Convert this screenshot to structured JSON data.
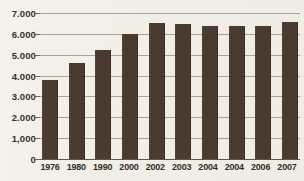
{
  "chart_data": {
    "type": "bar",
    "title": "",
    "xlabel": "",
    "ylabel": "",
    "grid": true,
    "legend": "none",
    "ylim": [
      0,
      7000
    ],
    "ytick_labels": [
      "7.000",
      "6.000",
      "5.000",
      "4.000",
      "3.000",
      "2.000",
      "1,000",
      "0"
    ],
    "ytick_values": [
      7000,
      6000,
      5000,
      4000,
      3000,
      2000,
      1000,
      0
    ],
    "categories": [
      "1976",
      "1980",
      "1990",
      "2000",
      "2002",
      "2003",
      "2004",
      "2004",
      "2006",
      "2007"
    ],
    "values": [
      3800,
      4600,
      5250,
      6000,
      6500,
      6450,
      6400,
      6400,
      6400,
      6550
    ],
    "bar_color": "#4a3a30",
    "grid_color": "#9a948c",
    "background_color": "#f3f0ea"
  }
}
